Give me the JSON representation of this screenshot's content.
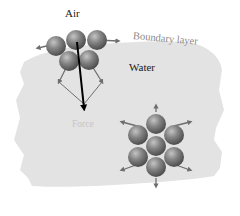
{
  "figure": {
    "labels": {
      "air": "Air",
      "boundary_layer": "Boundary layer",
      "water": "Water",
      "force": "Force"
    },
    "colors": {
      "water_region": "#e3e3e3",
      "molecule": "#7a7a7a",
      "molecule_highlight": "#b8b8b8",
      "attraction_arrow": "#6e6e6e",
      "net_force_arrow": "#000000",
      "boundary_text": "#8a8a8a",
      "force_text": "#c6c6c6"
    },
    "surface_cluster": {
      "description": "Surface molecules pulled sideways and downward only",
      "molecule_count": 5,
      "arrows": [
        "left",
        "right",
        "down-left",
        "down-right"
      ],
      "net_force": "down"
    },
    "bulk_cluster": {
      "description": "Interior molecule pulled equally in all directions",
      "molecule_count": 7,
      "arrows": [
        "up",
        "up-right",
        "down-right",
        "down",
        "down-left",
        "up-left"
      ]
    }
  }
}
